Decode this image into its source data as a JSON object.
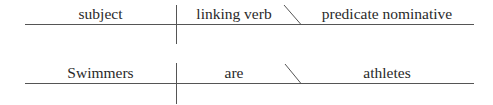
{
  "diagrams": [
    {
      "name": "template",
      "subject": "subject",
      "linking_verb": "linking verb",
      "predicate_nominative": "predicate nominative"
    },
    {
      "name": "example",
      "subject": "Swimmers",
      "linking_verb": "are",
      "predicate_nominative": "athletes"
    }
  ],
  "style": {
    "line_color": "#555555",
    "text_color": "#2a2a2a",
    "background": "#ffffff"
  }
}
